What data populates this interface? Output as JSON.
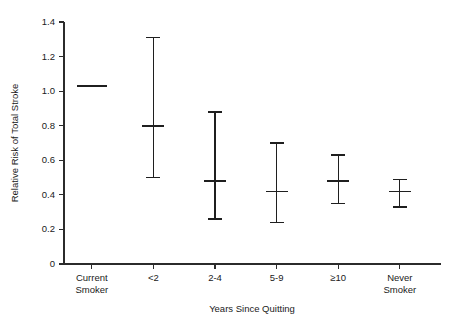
{
  "chart_data": {
    "type": "scatter",
    "title": "",
    "xlabel": "Years Since Quitting",
    "ylabel": "Relative Risk of Total Stroke",
    "categories": [
      "Current Smoker",
      "<2",
      "2-4",
      "5-9",
      "≥10",
      "Never Smoker"
    ],
    "category_lines": [
      [
        "Current",
        "Smoker"
      ],
      [
        "<2"
      ],
      [
        "2-4"
      ],
      [
        "5-9"
      ],
      [
        "≥10"
      ],
      [
        "Never",
        "Smoker"
      ]
    ],
    "values": [
      1.03,
      0.8,
      0.48,
      0.42,
      0.48,
      0.42
    ],
    "ci_lower": [
      null,
      0.5,
      0.26,
      0.24,
      0.35,
      0.33
    ],
    "ci_upper": [
      null,
      1.31,
      0.88,
      0.7,
      0.63,
      0.49
    ],
    "series": [
      {
        "name": "Relative Risk of Total Stroke",
        "points": [
          {
            "category": "Current Smoker",
            "value": 1.03,
            "ci_lower": null,
            "ci_upper": null,
            "marker": "line"
          },
          {
            "category": "<2",
            "value": 0.8,
            "ci_lower": 0.5,
            "ci_upper": 1.31,
            "marker": "errorbar"
          },
          {
            "category": "2-4",
            "value": 0.48,
            "ci_lower": 0.26,
            "ci_upper": 0.88,
            "marker": "errorbar"
          },
          {
            "category": "5-9",
            "value": 0.42,
            "ci_lower": 0.24,
            "ci_upper": 0.7,
            "marker": "errorbar"
          },
          {
            "category": "≥10",
            "value": 0.48,
            "ci_lower": 0.35,
            "ci_upper": 0.63,
            "marker": "errorbar"
          },
          {
            "category": "Never Smoker",
            "value": 0.42,
            "ci_lower": 0.33,
            "ci_upper": 0.49,
            "marker": "errorbar"
          }
        ]
      }
    ],
    "ylim": [
      0,
      1.4
    ],
    "yticks": [
      0,
      0.2,
      0.4,
      0.6,
      0.8,
      1.0,
      1.2,
      1.4
    ],
    "ytick_labels": [
      "0",
      "0.2",
      "0.4",
      "0.6",
      "0.8",
      "1.0",
      "1.2",
      "1.4"
    ],
    "grid": false,
    "legend": null,
    "colors": {
      "axis": "#2b2b2b",
      "marker": "#1f1f1f",
      "background": "#ffffff"
    }
  }
}
